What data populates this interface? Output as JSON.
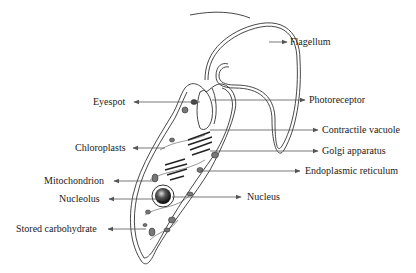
{
  "diagram": {
    "colors": {
      "line": "#333333",
      "arrow": "#555555",
      "text": "#222222",
      "background": "#ffffff"
    },
    "labels_left": [
      {
        "id": "eyespot",
        "text": "Eyespot",
        "x": 93,
        "y": 96
      },
      {
        "id": "chloroplasts",
        "text": "Chloroplasts",
        "x": 75,
        "y": 142
      },
      {
        "id": "mitochondrion",
        "text": "Mitochondrion",
        "x": 44,
        "y": 175
      },
      {
        "id": "nucleolus",
        "text": "Nucleolus",
        "x": 59,
        "y": 193
      },
      {
        "id": "stored-carbohydrate",
        "text": "Stored carbohydrate",
        "x": 16,
        "y": 223
      }
    ],
    "labels_right": [
      {
        "id": "flagellum",
        "text": "Flagellum",
        "x": 290,
        "y": 36
      },
      {
        "id": "photoreceptor",
        "text": "Photoreceptor",
        "x": 309,
        "y": 94
      },
      {
        "id": "contractile-vacuole",
        "text": "Contractile vacuole",
        "x": 322,
        "y": 124
      },
      {
        "id": "golgi-apparatus",
        "text": "Golgi apparatus",
        "x": 322,
        "y": 145
      },
      {
        "id": "endoplasmic-reticulum",
        "text": "Endoplasmic reticulum",
        "x": 305,
        "y": 165
      },
      {
        "id": "nucleus",
        "text": "Nucleus",
        "x": 247,
        "y": 191
      }
    ]
  }
}
